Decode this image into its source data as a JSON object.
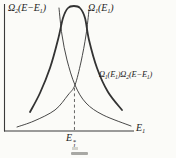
{
  "figure": {
    "colors": {
      "background": "#fbfbf8",
      "line": "#333333",
      "axis": "#3a3a3a",
      "dashed": "#555555",
      "text": "#222222"
    },
    "labels": {
      "omega2": {
        "text": "Ω₂(E−E₁)",
        "segments": [
          [
            "n",
            "Ω"
          ],
          [
            "sub",
            "2"
          ],
          [
            "n",
            "(E−E"
          ],
          [
            "sub",
            "1"
          ],
          [
            "n",
            ")"
          ]
        ]
      },
      "omega1": {
        "text": "Ω₁(E₁)",
        "segments": [
          [
            "n",
            "Ω"
          ],
          [
            "sub",
            "1"
          ],
          [
            "n",
            "(E"
          ],
          [
            "sub",
            "1"
          ],
          [
            "n",
            ")"
          ]
        ]
      },
      "product": {
        "text": "Ω₁(E₁)Ω₂(E−E₁)",
        "segments": [
          [
            "n",
            "Ω"
          ],
          [
            "sub",
            "1"
          ],
          [
            "n",
            "(E"
          ],
          [
            "sub",
            "1"
          ],
          [
            "n",
            ")Ω"
          ],
          [
            "sub",
            "2"
          ],
          [
            "n",
            "(E−E"
          ],
          [
            "sub",
            "1"
          ],
          [
            "n",
            ")"
          ]
        ]
      },
      "x_axis": {
        "text": "E₁",
        "segments": [
          [
            "n",
            "E"
          ],
          [
            "sub",
            "1"
          ]
        ]
      },
      "peak": {
        "base": "E",
        "sup": "*",
        "sub": "1"
      }
    }
  },
  "chart_data": {
    "type": "line",
    "title": "",
    "xlabel": "E₁",
    "ylabel": "",
    "grid": false,
    "legend": "curve labels placed beside curves",
    "x_range_norm": [
      0,
      1
    ],
    "y_range_norm": [
      0,
      1
    ],
    "annotations": [
      {
        "kind": "dashed-vertical",
        "x": 0.542,
        "y_bottom": 0.008,
        "y_top": 0.344,
        "label": "E₁*"
      }
    ],
    "series": [
      {
        "key": "omega2",
        "name": "Ω₂(E−E₁)",
        "style": "thin",
        "points": [
          [
            0.423,
            0.984
          ],
          [
            0.446,
            0.768
          ],
          [
            0.485,
            0.568
          ],
          [
            0.546,
            0.368
          ],
          [
            0.631,
            0.224
          ],
          [
            0.762,
            0.128
          ],
          [
            0.977,
            0.04
          ]
        ]
      },
      {
        "key": "omega1",
        "name": "Ω₁(E₁)",
        "style": "thin",
        "points": [
          [
            0.1,
            0.032
          ],
          [
            0.231,
            0.08
          ],
          [
            0.392,
            0.168
          ],
          [
            0.492,
            0.288
          ],
          [
            0.546,
            0.368
          ],
          [
            0.592,
            0.552
          ],
          [
            0.631,
            0.768
          ],
          [
            0.654,
            0.968
          ]
        ]
      },
      {
        "key": "product",
        "name": "Ω₁(E₁)Ω₂(E−E₁)",
        "style": "thick",
        "points": [
          [
            0.2,
            0.152
          ],
          [
            0.277,
            0.304
          ],
          [
            0.354,
            0.504
          ],
          [
            0.415,
            0.728
          ],
          [
            0.454,
            0.904
          ],
          [
            0.492,
            0.984
          ],
          [
            0.538,
            1.0
          ],
          [
            0.585,
            0.984
          ],
          [
            0.623,
            0.904
          ],
          [
            0.654,
            0.728
          ],
          [
            0.715,
            0.504
          ],
          [
            0.8,
            0.312
          ],
          [
            0.908,
            0.168
          ]
        ]
      }
    ]
  }
}
